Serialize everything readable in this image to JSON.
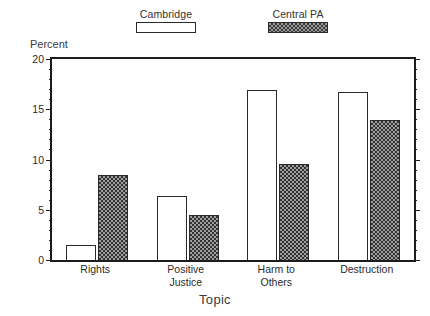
{
  "chart_data": {
    "type": "bar",
    "title": "",
    "xlabel": "Topic",
    "ylabel": "Percent",
    "ylim": [
      0,
      20
    ],
    "yticks": [
      0,
      5,
      10,
      15,
      20
    ],
    "ytick_labels": [
      "0",
      "5",
      "10",
      "15",
      "20"
    ],
    "grid": false,
    "legend_position": "top",
    "categories": [
      "Rights",
      "Positive Justice",
      "Harm to Others",
      "Destruction"
    ],
    "category_lines": [
      [
        "Rights"
      ],
      [
        "Positive",
        "Justice"
      ],
      [
        "Harm to",
        "Others"
      ],
      [
        "Destruction"
      ]
    ],
    "series": [
      {
        "name": "Cambridge",
        "fill": "open",
        "values": [
          1.5,
          6.4,
          16.9,
          16.7
        ]
      },
      {
        "name": "Central PA",
        "fill": "hatched",
        "values": [
          8.5,
          4.5,
          9.6,
          13.9
        ]
      }
    ]
  },
  "legend": {
    "entries": [
      {
        "label": "Cambridge",
        "swatch": "open-rectangle-swatch"
      },
      {
        "label": "Central PA",
        "swatch": "hatched-rectangle-swatch"
      }
    ]
  },
  "axes": {
    "y_title": "Percent",
    "x_title": "Topic"
  },
  "colors": {
    "axis": "#1c1c1c",
    "bar_outline": "#2a2a2a",
    "hatch_fill": "#9e9e9e",
    "hatch_pattern": "#333333",
    "background": "#ffffff"
  }
}
